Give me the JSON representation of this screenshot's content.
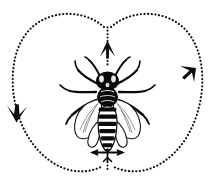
{
  "figure": {
    "title": "Honeybee waggle dance figure-eight pattern",
    "subject": "honeybee",
    "view": "dorsal",
    "background_color": "#ffffff",
    "ink_color": "#0a0a0a",
    "width": 215,
    "height": 194
  },
  "diagram": {
    "pattern_name": "figure-eight",
    "path_style": "dotted",
    "dot_color": "#111111",
    "loops": [
      {
        "name": "left-loop",
        "direction": "counterclockwise",
        "label": "left-circuit"
      },
      {
        "name": "right-loop",
        "direction": "clockwise",
        "label": "right-circuit"
      }
    ],
    "waggle_run": {
      "name": "waggle-run",
      "orientation": "vertical",
      "direction": "upward",
      "label": "waggle-run"
    },
    "arrows": [
      {
        "name": "top-arrow",
        "points": "up",
        "position": "top-center"
      },
      {
        "name": "right-arrow",
        "points": "down",
        "position": "upper-right"
      },
      {
        "name": "left-arrow",
        "points": "down",
        "position": "mid-left"
      },
      {
        "name": "waggle-arrow",
        "points": "left-right",
        "position": "abdomen-tip"
      }
    ]
  },
  "bee": {
    "name": "honeybee",
    "parts": [
      {
        "name": "head",
        "label": "head"
      },
      {
        "name": "antennae",
        "label": "antennae"
      },
      {
        "name": "thorax",
        "label": "thorax"
      },
      {
        "name": "abdomen",
        "label": "abdomen"
      },
      {
        "name": "forewings",
        "label": "forewings"
      },
      {
        "name": "legs",
        "label": "legs"
      }
    ],
    "leg_count": 6,
    "wing_count": 4,
    "antenna_count": 2
  }
}
